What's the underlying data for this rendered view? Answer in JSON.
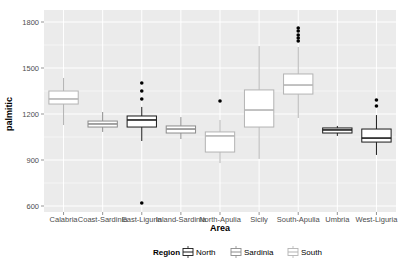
{
  "chart_data": {
    "type": "boxplot",
    "title": "",
    "xlabel": "Area",
    "ylabel": "palmitic",
    "ylim": [
      540,
      1850
    ],
    "yticks": [
      600,
      900,
      1200,
      1500,
      1800
    ],
    "grid": true,
    "legend": {
      "title": "Region",
      "position": "bottom",
      "entries": [
        {
          "name": "North",
          "color": "#1a1a1a"
        },
        {
          "name": "Sardinia",
          "color": "#8c8c8c"
        },
        {
          "name": "South",
          "color": "#b3b3b3"
        }
      ]
    },
    "categories": [
      "Calabria",
      "Coast-Sardinia",
      "East-Liguria",
      "Inland-Sardinia",
      "North-Apulia",
      "Sicily",
      "South-Apulia",
      "Umbria",
      "West-Liguria"
    ],
    "series": [
      {
        "name": "Calabria",
        "region": "South",
        "whisker_low": 1128,
        "q1": 1265,
        "median": 1298,
        "q3": 1350,
        "whisker_high": 1435,
        "outliers": []
      },
      {
        "name": "Coast-Sardinia",
        "region": "Sardinia",
        "whisker_low": 1083,
        "q1": 1115,
        "median": 1135,
        "q3": 1154,
        "whisker_high": 1213,
        "outliers": []
      },
      {
        "name": "East-Liguria",
        "region": "North",
        "whisker_low": 1024,
        "q1": 1115,
        "median": 1161,
        "q3": 1187,
        "whisker_high": 1246,
        "outliers": [
          1298,
          1350,
          1402,
          620
        ]
      },
      {
        "name": "Inland-Sardinia",
        "region": "Sardinia",
        "whisker_low": 1037,
        "q1": 1076,
        "median": 1102,
        "q3": 1122,
        "whisker_high": 1180,
        "outliers": []
      },
      {
        "name": "North-Apulia",
        "region": "South",
        "whisker_low": 880,
        "q1": 952,
        "median": 1057,
        "q3": 1083,
        "whisker_high": 1161,
        "outliers": [
          1285
        ]
      },
      {
        "name": "Sicily",
        "region": "South",
        "whisker_low": 907,
        "q1": 1115,
        "median": 1226,
        "q3": 1357,
        "whisker_high": 1643,
        "outliers": []
      },
      {
        "name": "South-Apulia",
        "region": "South",
        "whisker_low": 1174,
        "q1": 1330,
        "median": 1389,
        "q3": 1461,
        "whisker_high": 1637,
        "outliers": [
          1676,
          1696,
          1715,
          1741,
          1761
        ]
      },
      {
        "name": "Umbria",
        "region": "North",
        "whisker_low": 1057,
        "q1": 1076,
        "median": 1096,
        "q3": 1109,
        "whisker_high": 1122,
        "outliers": []
      },
      {
        "name": "West-Liguria",
        "region": "North",
        "whisker_low": 933,
        "q1": 1017,
        "median": 1043,
        "q3": 1102,
        "whisker_high": 1193,
        "outliers": [
          1252,
          1291
        ]
      }
    ]
  }
}
